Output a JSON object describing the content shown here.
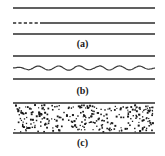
{
  "figure": {
    "width": 165,
    "height": 156,
    "background_color": "#ffffff",
    "line_color": "#2b2b2b",
    "dot_color": "#1a1a1a",
    "channel_x_start": 13,
    "channel_x_end": 155
  },
  "panels": [
    {
      "id": "a",
      "caption": "(a)",
      "description": "three-horizontal-lines",
      "lines": [
        {
          "name": "upper-wall-line",
          "y": 8,
          "style": "solid"
        },
        {
          "name": "center-interface-line",
          "y": 23,
          "style": "dashed-then-solid",
          "dash_end_x": 40
        },
        {
          "name": "lower-wall-line",
          "y": 34,
          "style": "solid"
        }
      ]
    },
    {
      "id": "b",
      "caption": "(b)",
      "description": "wavy-interface-between-walls",
      "lines": [
        {
          "name": "upper-wall-line",
          "y": 6,
          "style": "solid"
        },
        {
          "name": "lower-wall-line",
          "y": 29,
          "style": "solid"
        }
      ],
      "wave": {
        "name": "wavy-interface-line",
        "baseline_y": 18,
        "amplitude": 2.0,
        "periods": 7
      }
    },
    {
      "id": "c",
      "caption": "(c)",
      "description": "channel-filled-with-dispersed-particles",
      "lines": [
        {
          "name": "upper-wall-line",
          "y": 3,
          "style": "solid"
        },
        {
          "name": "lower-wall-line",
          "y": 33,
          "style": "solid"
        }
      ],
      "speckle": {
        "name": "particle-field",
        "count": 300,
        "dot_size": 1.5,
        "region_top": 5,
        "region_bottom": 32
      }
    }
  ],
  "chart_data": {
    "type": "diagram",
    "title": "",
    "panel_labels": [
      "(a)",
      "(b)",
      "(c)"
    ],
    "series": [
      {
        "name": "panel-a-flat-interface",
        "values": [
          0,
          0,
          0,
          0,
          0,
          0,
          0,
          0,
          0
        ]
      },
      {
        "name": "panel-b-wavy-interface",
        "values": [
          0,
          1.4,
          2,
          1.4,
          0,
          -1.4,
          -2,
          -1.4,
          0
        ]
      },
      {
        "name": "panel-c-particle-density",
        "values": [
          1,
          1,
          1,
          1,
          1,
          1,
          1,
          1,
          1
        ]
      }
    ]
  }
}
